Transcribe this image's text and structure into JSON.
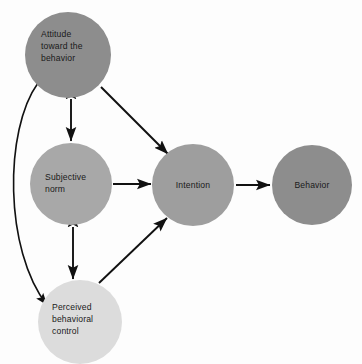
{
  "diagram": {
    "background_color": "#fdfdfd",
    "nodes": [
      {
        "id": "attitude",
        "label_lines": [
          "Attitude",
          "toward the",
          "behavior"
        ],
        "fill": "#8d8d8d",
        "cx": 68,
        "cy": 55,
        "r": 43
      },
      {
        "id": "subjective-norm",
        "label_lines": [
          "Subjective",
          "norm"
        ],
        "fill": "#a8a8a8",
        "cx": 71,
        "cy": 184,
        "r": 41
      },
      {
        "id": "perceived-behavioral-control",
        "label_lines": [
          "Perceived",
          "behavioral",
          "control"
        ],
        "fill": "#dcdcdc",
        "cx": 80,
        "cy": 322,
        "r": 42
      },
      {
        "id": "intention",
        "label_lines": [
          "Intention"
        ],
        "fill": "#9e9e9e",
        "cx": 193,
        "cy": 185,
        "r": 41
      },
      {
        "id": "behavior",
        "label_lines": [
          "Behavior"
        ],
        "fill": "#8d8d8d",
        "cx": 312,
        "cy": 185,
        "r": 40
      }
    ],
    "edges": [
      {
        "id": "attitude-to-intention",
        "from": "attitude",
        "to": "intention",
        "style": "straight",
        "arrowheads": "single"
      },
      {
        "id": "subjective-norm-to-intention",
        "from": "subjective-norm",
        "to": "intention",
        "style": "straight",
        "arrowheads": "single"
      },
      {
        "id": "pbc-to-intention",
        "from": "perceived-behavioral-control",
        "to": "intention",
        "style": "straight",
        "arrowheads": "single"
      },
      {
        "id": "intention-to-behavior",
        "from": "intention",
        "to": "behavior",
        "style": "straight",
        "arrowheads": "single"
      },
      {
        "id": "attitude-subjective-norm",
        "from": "attitude",
        "to": "subjective-norm",
        "style": "straight",
        "arrowheads": "double"
      },
      {
        "id": "subjective-norm-pbc",
        "from": "subjective-norm",
        "to": "perceived-behavioral-control",
        "style": "straight",
        "arrowheads": "double"
      },
      {
        "id": "attitude-pbc",
        "from": "attitude",
        "to": "perceived-behavioral-control",
        "style": "curved",
        "arrowheads": "double"
      }
    ],
    "colors": {
      "arrow": "#111111",
      "text": "#1a1a1a",
      "node_dark": "#8d8d8d",
      "node_mid": "#9e9e9e",
      "node_light": "#a8a8a8",
      "node_lightest": "#dcdcdc"
    }
  }
}
